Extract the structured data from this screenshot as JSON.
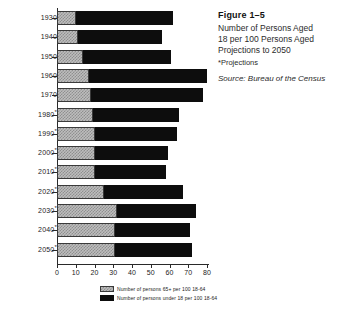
{
  "caption": {
    "figure_number": "Figure  1–5",
    "lines": [
      "Number of Persons Aged",
      "18 per 100 Persons Aged",
      "Projections to 2050"
    ],
    "note": "*Projections",
    "source": "Source: Bureau of the Census"
  },
  "legend": {
    "items": [
      {
        "label": "Number of persons 65+ per 100 18-64",
        "color": "#bdbdbd",
        "pattern": "checker"
      },
      {
        "label": "Number of persons under 18 per 100 18-64",
        "color": "#0d0d0d",
        "pattern": "solid"
      }
    ]
  },
  "chart_data": {
    "type": "bar",
    "orientation": "horizontal",
    "stacked": true,
    "title": "Number of Persons Aged 18 per 100 Persons Aged Projections to 2050",
    "xlabel": "",
    "ylabel": "",
    "xlim": [
      0,
      80
    ],
    "xticks": [
      0,
      10,
      20,
      30,
      40,
      50,
      60,
      70,
      80
    ],
    "xticklabels": [
      "0",
      "10",
      "20",
      "30",
      "40",
      "50",
      "60",
      "70",
      "80"
    ],
    "grid": false,
    "legend_position": "bottom",
    "categories": [
      "1930",
      "1940",
      "1950",
      "1960",
      "1970",
      "1980*",
      "1990*",
      "2000*",
      "2010*",
      "2020*",
      "2030*",
      "2040*",
      "2050*"
    ],
    "series": [
      {
        "name": "Number of persons 65+ per 100 18-64",
        "values": [
          10,
          11,
          14,
          17,
          18,
          19,
          20,
          20,
          20,
          25,
          32,
          31,
          31
        ]
      },
      {
        "name": "Number of persons under 18 per 100 18-64",
        "values": [
          52,
          45,
          47,
          63,
          60,
          46,
          44,
          39,
          38,
          42,
          42,
          40,
          41
        ]
      }
    ],
    "totals": [
      62,
      56,
      61,
      80,
      78,
      65,
      64,
      59,
      58,
      67,
      74,
      71,
      72
    ]
  }
}
